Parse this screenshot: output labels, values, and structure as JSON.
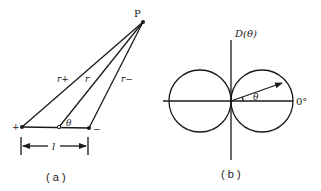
{
  "panel_a": {
    "caption": "( a )",
    "point_label": "P",
    "line_labels": {
      "r_plus": "r+",
      "r": "r",
      "r_minus": "r−"
    },
    "angle_label": "θ",
    "plus_charge": "+",
    "minus_charge": "−",
    "separation_label": "l"
  },
  "panel_b": {
    "caption": "( b )",
    "axis_label": "D(θ)",
    "angle_label": "θ",
    "zero_label": "0°"
  }
}
